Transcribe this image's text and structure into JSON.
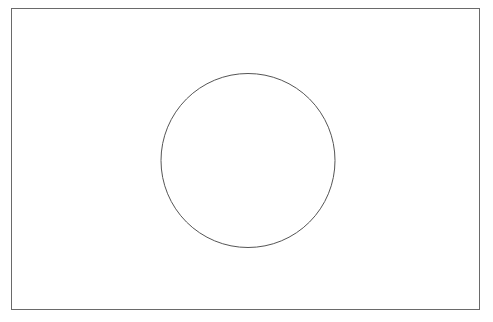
{
  "canvas": {
    "width": 493,
    "height": 322,
    "background_color": "#ffffff",
    "title": "Flag outline line drawing"
  },
  "figure": {
    "name": "flag-of-japan-outline",
    "stroke_width": 1,
    "fill": "none"
  },
  "shapes": {
    "flag_border": {
      "name": "flag-border-rectangle",
      "type": "rect",
      "x": 11,
      "y": 8,
      "width": 468,
      "height": 301,
      "stroke_color": "#6a6a6a",
      "stroke_width": 1,
      "fill_color": "none"
    },
    "disc": {
      "name": "flag-center-circle",
      "type": "circle",
      "cx": 248,
      "cy": 160.5,
      "r": 87,
      "stroke_color": "#555555",
      "stroke_width": 1,
      "fill_color": "none"
    }
  },
  "chart_data": {
    "type": "diagram",
    "elements": [
      {
        "label": "Outer field",
        "shape": "rectangle",
        "x": 11,
        "y": 8,
        "width": 468,
        "height": 301
      },
      {
        "label": "Central disc",
        "shape": "circle",
        "center_x": 248,
        "center_y": 160.5,
        "radius": 87
      }
    ]
  }
}
